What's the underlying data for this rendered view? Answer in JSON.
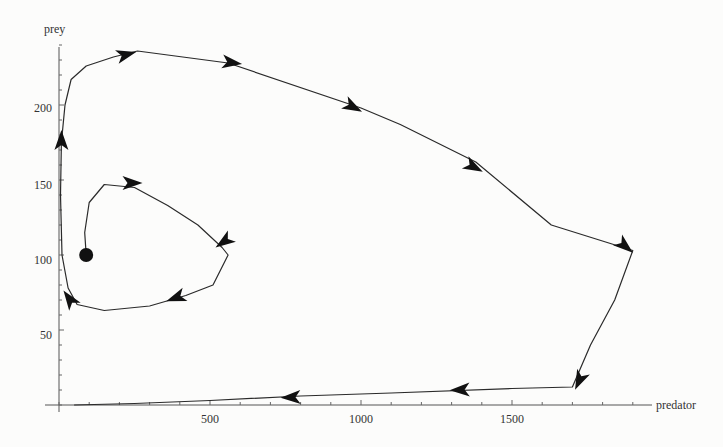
{
  "chart_data": {
    "type": "line",
    "subtype": "phase-portrait",
    "title": "",
    "xlabel": "predator",
    "ylabel": "prey",
    "xlim": [
      0,
      1950
    ],
    "ylim": [
      0,
      240
    ],
    "x_ticks": [
      500,
      1000,
      1500
    ],
    "y_ticks": [
      50,
      100,
      150,
      200
    ],
    "x_minor_step": 100,
    "y_minor_step": 10,
    "grid": false,
    "legend": null,
    "start_point": {
      "x": 90,
      "y": 100
    },
    "series": [
      {
        "name": "trajectory",
        "points": [
          [
            90,
            100
          ],
          [
            85,
            115
          ],
          [
            100,
            135
          ],
          [
            150,
            147
          ],
          [
            250,
            145
          ],
          [
            360,
            133
          ],
          [
            460,
            120
          ],
          [
            540,
            105
          ],
          [
            560,
            100
          ],
          [
            510,
            80
          ],
          [
            420,
            73
          ],
          [
            300,
            66
          ],
          [
            150,
            63
          ],
          [
            60,
            67
          ],
          [
            30,
            78
          ],
          [
            10,
            100
          ],
          [
            5,
            140
          ],
          [
            8,
            175
          ],
          [
            20,
            200
          ],
          [
            40,
            217
          ],
          [
            90,
            226
          ],
          [
            180,
            232
          ],
          [
            260,
            236
          ],
          [
            560,
            228
          ],
          [
            1000,
            198
          ],
          [
            1130,
            187
          ],
          [
            1380,
            162
          ],
          [
            1630,
            120
          ],
          [
            1900,
            103
          ],
          [
            1840,
            70
          ],
          [
            1760,
            40
          ],
          [
            1700,
            12
          ],
          [
            1500,
            11
          ],
          [
            1100,
            8
          ],
          [
            800,
            6
          ],
          [
            500,
            3
          ],
          [
            250,
            1
          ],
          [
            50,
            0
          ]
        ],
        "arrows_at": [
          {
            "x": 250,
            "y": 148,
            "dir": "right"
          },
          {
            "x": 540,
            "y": 108,
            "dir": "down"
          },
          {
            "x": 380,
            "y": 71,
            "dir": "left"
          },
          {
            "x": 30,
            "y": 72,
            "dir": "up-left"
          },
          {
            "x": 8,
            "y": 178,
            "dir": "up"
          },
          {
            "x": 230,
            "y": 234,
            "dir": "right"
          },
          {
            "x": 580,
            "y": 228,
            "dir": "right"
          },
          {
            "x": 980,
            "y": 198,
            "dir": "right-down"
          },
          {
            "x": 1380,
            "y": 158,
            "dir": "right-down"
          },
          {
            "x": 1880,
            "y": 105,
            "dir": "right-down"
          },
          {
            "x": 1720,
            "y": 15,
            "dir": "down"
          },
          {
            "x": 1320,
            "y": 10,
            "dir": "left"
          },
          {
            "x": 760,
            "y": 5,
            "dir": "left"
          }
        ]
      }
    ]
  },
  "labels": {
    "xlabel": "predator",
    "ylabel": "prey",
    "xticks": [
      "500",
      "1000",
      "1500"
    ],
    "yticks": [
      "50",
      "100",
      "150",
      "200"
    ]
  },
  "colors": {
    "background": "#fcfcfb",
    "line": "#2a2a2a",
    "axis": "#555555"
  }
}
